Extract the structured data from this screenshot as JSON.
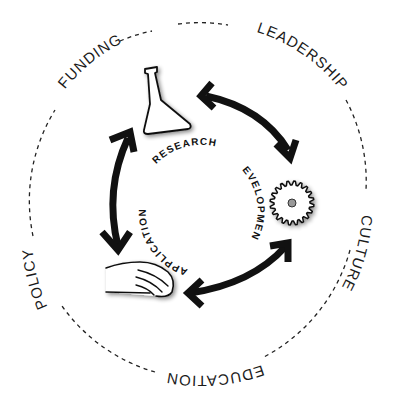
{
  "diagram": {
    "outer_ring": {
      "style": "dashed",
      "labels": [
        {
          "id": "funding",
          "text": "FUNDING"
        },
        {
          "id": "leadership",
          "text": "LEADERSHIP"
        },
        {
          "id": "culture",
          "text": "CULTURE"
        },
        {
          "id": "education",
          "text": "EDUCATION"
        },
        {
          "id": "policy",
          "text": "POLICY"
        }
      ]
    },
    "inner_cycle": {
      "stages": [
        {
          "id": "research",
          "text": "RESEARCH",
          "icon": "flask-icon"
        },
        {
          "id": "development",
          "text": "DEVELOPMENT",
          "icon": "gear-icon"
        },
        {
          "id": "application",
          "text": "APPLICATION",
          "icon": "hand-icon"
        }
      ],
      "arrows": [
        {
          "from": "research",
          "to": "development",
          "type": "double-headed"
        },
        {
          "from": "development",
          "to": "application",
          "type": "double-headed"
        },
        {
          "from": "application",
          "to": "research",
          "type": "double-headed"
        }
      ]
    },
    "colors": {
      "background": "#ffffff",
      "ink": "#111111",
      "gear_hub": "#999999"
    }
  }
}
